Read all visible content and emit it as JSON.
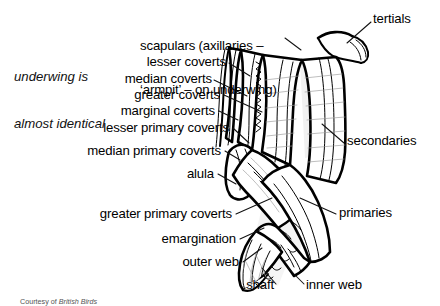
{
  "figure": {
    "page_header_fragment": "  ",
    "credit_prefix": "Courtesy of ",
    "credit_source": "British Birds"
  },
  "note": {
    "line1": "underwing is",
    "line2": "almost identical"
  },
  "labels": {
    "scapulars_line1": "scapulars (axillaries –",
    "scapulars_line2": "‘armpit’ – on underwing)",
    "tertials": "tertials",
    "lesser_coverts": "lesser coverts",
    "median_coverts": "median coverts",
    "greater_coverts": "greater coverts",
    "marginal_coverts": "marginal coverts",
    "lesser_primary_coverts": "lesser primary coverts",
    "median_primary_coverts": "median primary coverts",
    "alula": "alula",
    "greater_primary_coverts": "greater primary coverts",
    "emargination": "emargination",
    "outer_web": "outer web",
    "shaft": "shaft",
    "inner_web": "inner web",
    "secondaries": "secondaries",
    "primaries": "primaries"
  },
  "colors": {
    "ink": "#000000",
    "background": "#ffffff",
    "leader": "#111111",
    "shading": "#d8d8d8"
  }
}
